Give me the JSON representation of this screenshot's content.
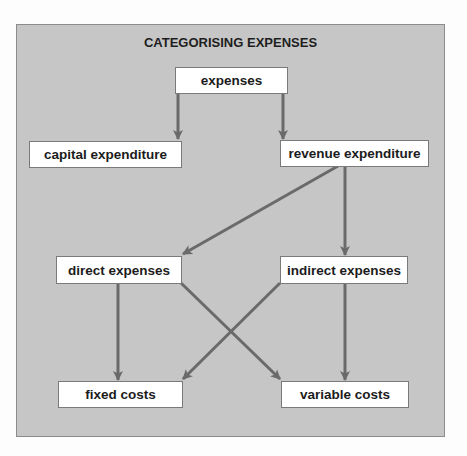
{
  "diagram": {
    "title": "CATEGORISING EXPENSES",
    "colors": {
      "background": "#c6c6c6",
      "node_fill": "#ffffff",
      "node_border": "#7a7a7a",
      "arrow": "#6a6a6a",
      "text": "#1c1c1c"
    },
    "nodes": {
      "expenses": "expenses",
      "capital_expenditure": "capital expenditure",
      "revenue_expenditure": "revenue expenditure",
      "direct_expenses": "direct expenses",
      "indirect_expenses": "indirect expenses",
      "fixed_costs": "fixed costs",
      "variable_costs": "variable costs"
    },
    "edges": [
      {
        "from": "expenses",
        "to": "capital expenditure"
      },
      {
        "from": "expenses",
        "to": "revenue expenditure"
      },
      {
        "from": "revenue expenditure",
        "to": "direct expenses"
      },
      {
        "from": "revenue expenditure",
        "to": "indirect expenses"
      },
      {
        "from": "direct expenses",
        "to": "fixed costs"
      },
      {
        "from": "direct expenses",
        "to": "variable costs"
      },
      {
        "from": "indirect expenses",
        "to": "fixed costs"
      },
      {
        "from": "indirect expenses",
        "to": "variable costs"
      }
    ]
  }
}
